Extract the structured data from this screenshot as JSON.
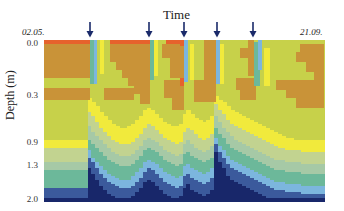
{
  "chart_data": {
    "type": "heatmap",
    "title": "Time",
    "xlabel": "Time",
    "ylabel": "Depth (m)",
    "x_start_label": "02.05.",
    "x_end_label": "21.09.",
    "y_ticks": [
      {
        "label": "0.0",
        "depth": 0.0
      },
      {
        "label": "0.3",
        "depth": 0.3
      },
      {
        "label": "0.9",
        "depth": 0.9
      },
      {
        "label": "1.3",
        "depth": 1.3
      },
      {
        "label": "2.0",
        "depth": 2.0
      }
    ],
    "ylim": [
      0.0,
      2.0
    ],
    "event_arrows_px": [
      90,
      149,
      184,
      217,
      253
    ],
    "colors": {
      "orange": "#e6622c",
      "brown": "#c99338",
      "yellowgreen": "#c7d14a",
      "yellow": "#f1ea3c",
      "pale": "#c2d390",
      "greygreen": "#a6c9a6",
      "teal": "#6cb89a",
      "lightblue": "#7cb6de",
      "blue": "#3b5a9c",
      "navy": "#18276a",
      "arrow": "#1a2a6a"
    },
    "columns": 70,
    "lower_layers_px_from_top": {
      "order": [
        "yellow",
        "pale",
        "greygreen",
        "teal",
        "lightblue",
        "blue",
        "navy"
      ],
      "values": [
        [
          100,
          108,
          122,
          130,
          148,
          148,
          158
        ],
        [
          100,
          108,
          122,
          130,
          148,
          148,
          158
        ],
        [
          100,
          108,
          122,
          130,
          148,
          148,
          158
        ],
        [
          100,
          108,
          122,
          130,
          148,
          148,
          158
        ],
        [
          100,
          108,
          122,
          130,
          148,
          148,
          158
        ],
        [
          100,
          108,
          122,
          130,
          148,
          148,
          158
        ],
        [
          100,
          108,
          122,
          130,
          148,
          148,
          158
        ],
        [
          100,
          108,
          122,
          130,
          148,
          148,
          158
        ],
        [
          100,
          108,
          122,
          130,
          148,
          148,
          158
        ],
        [
          100,
          108,
          122,
          130,
          148,
          148,
          158
        ],
        [
          100,
          108,
          122,
          130,
          148,
          148,
          158
        ],
        [
          58,
          72,
          86,
          100,
          110,
          118,
          128
        ],
        [
          62,
          76,
          92,
          104,
          118,
          122,
          134
        ],
        [
          66,
          82,
          96,
          108,
          122,
          128,
          140
        ],
        [
          72,
          88,
          100,
          112,
          126,
          134,
          146
        ],
        [
          76,
          92,
          104,
          116,
          130,
          138,
          150
        ],
        [
          80,
          96,
          108,
          120,
          134,
          142,
          154
        ],
        [
          84,
          100,
          112,
          122,
          136,
          144,
          156
        ],
        [
          86,
          102,
          114,
          124,
          138,
          146,
          158
        ],
        [
          88,
          104,
          116,
          126,
          140,
          148,
          158
        ],
        [
          88,
          104,
          116,
          126,
          140,
          148,
          158
        ],
        [
          86,
          104,
          116,
          126,
          140,
          148,
          158
        ],
        [
          84,
          102,
          114,
          124,
          136,
          146,
          156
        ],
        [
          80,
          98,
          110,
          120,
          132,
          142,
          152
        ],
        [
          76,
          94,
          106,
          116,
          128,
          138,
          148
        ],
        [
          70,
          88,
          100,
          110,
          122,
          132,
          142
        ],
        [
          68,
          84,
          98,
          108,
          120,
          128,
          140
        ],
        [
          70,
          86,
          100,
          110,
          122,
          130,
          142
        ],
        [
          74,
          90,
          102,
          112,
          124,
          134,
          146
        ],
        [
          78,
          94,
          106,
          116,
          128,
          138,
          150
        ],
        [
          82,
          98,
          110,
          120,
          132,
          142,
          154
        ],
        [
          84,
          100,
          112,
          122,
          134,
          144,
          156
        ],
        [
          86,
          102,
          114,
          124,
          136,
          146,
          158
        ],
        [
          86,
          104,
          116,
          126,
          138,
          148,
          158
        ],
        [
          84,
          102,
          114,
          124,
          136,
          146,
          156
        ],
        [
          74,
          92,
          104,
          114,
          126,
          136,
          148
        ],
        [
          70,
          88,
          100,
          112,
          124,
          134,
          144
        ],
        [
          74,
          90,
          104,
          116,
          128,
          138,
          150
        ],
        [
          78,
          94,
          108,
          118,
          130,
          140,
          152
        ],
        [
          80,
          98,
          110,
          120,
          132,
          142,
          154
        ],
        [
          82,
          100,
          112,
          122,
          134,
          144,
          156
        ],
        [
          80,
          98,
          110,
          120,
          132,
          142,
          154
        ],
        [
          76,
          94,
          106,
          118,
          128,
          138,
          150
        ],
        [
          56,
          64,
          76,
          88,
          98,
          104,
          112
        ],
        [
          60,
          70,
          82,
          94,
          106,
          112,
          122
        ],
        [
          62,
          74,
          88,
          98,
          110,
          118,
          128
        ],
        [
          66,
          80,
          92,
          104,
          116,
          124,
          136
        ],
        [
          70,
          84,
          96,
          108,
          120,
          128,
          140
        ],
        [
          72,
          86,
          100,
          110,
          122,
          130,
          142
        ],
        [
          74,
          88,
          102,
          112,
          124,
          132,
          144
        ],
        [
          76,
          90,
          104,
          114,
          126,
          134,
          146
        ],
        [
          78,
          92,
          106,
          116,
          128,
          136,
          148
        ],
        [
          80,
          94,
          108,
          118,
          130,
          138,
          150
        ],
        [
          82,
          96,
          110,
          120,
          132,
          140,
          152
        ],
        [
          84,
          98,
          112,
          122,
          134,
          142,
          154
        ],
        [
          86,
          100,
          114,
          124,
          136,
          144,
          156
        ],
        [
          88,
          102,
          116,
          126,
          138,
          146,
          158
        ],
        [
          90,
          104,
          118,
          128,
          140,
          148,
          160
        ],
        [
          92,
          106,
          120,
          130,
          142,
          150,
          162
        ],
        [
          94,
          108,
          120,
          130,
          142,
          150,
          162
        ],
        [
          96,
          108,
          120,
          130,
          142,
          150,
          162
        ],
        [
          98,
          110,
          122,
          132,
          144,
          152,
          162
        ],
        [
          98,
          110,
          122,
          132,
          144,
          152,
          162
        ],
        [
          100,
          110,
          122,
          132,
          144,
          152,
          162
        ],
        [
          100,
          110,
          122,
          132,
          144,
          152,
          162
        ],
        [
          100,
          112,
          124,
          134,
          146,
          154,
          162
        ],
        [
          100,
          112,
          124,
          134,
          146,
          154,
          162
        ],
        [
          100,
          112,
          124,
          134,
          146,
          154,
          162
        ],
        [
          100,
          112,
          124,
          134,
          146,
          154,
          162
        ],
        [
          100,
          112,
          124,
          134,
          146,
          154,
          162
        ],
        [
          100,
          112,
          124,
          134,
          146,
          154,
          162
        ]
      ]
    },
    "upper_blocks": [
      {
        "x": 0,
        "y": 0,
        "w": 46,
        "h": 4,
        "color": "orange"
      },
      {
        "x": 0,
        "y": 4,
        "w": 46,
        "h": 34,
        "color": "brown"
      },
      {
        "x": 20,
        "y": 30,
        "w": 26,
        "h": 8,
        "color": "brown"
      },
      {
        "x": 0,
        "y": 48,
        "w": 46,
        "h": 12,
        "color": "brown"
      },
      {
        "x": 46,
        "y": 0,
        "w": 5,
        "h": 44,
        "color": "teal"
      },
      {
        "x": 50,
        "y": 0,
        "w": 3,
        "h": 44,
        "color": "lightblue"
      },
      {
        "x": 56,
        "y": 0,
        "w": 4,
        "h": 34,
        "color": "yellow"
      },
      {
        "x": 66,
        "y": 0,
        "w": 40,
        "h": 4,
        "color": "orange"
      },
      {
        "x": 66,
        "y": 4,
        "w": 40,
        "h": 18,
        "color": "brown"
      },
      {
        "x": 72,
        "y": 22,
        "w": 34,
        "h": 8,
        "color": "brown"
      },
      {
        "x": 78,
        "y": 30,
        "w": 28,
        "h": 8,
        "color": "brown"
      },
      {
        "x": 84,
        "y": 38,
        "w": 22,
        "h": 8,
        "color": "brown"
      },
      {
        "x": 90,
        "y": 46,
        "w": 16,
        "h": 8,
        "color": "brown"
      },
      {
        "x": 60,
        "y": 48,
        "w": 30,
        "h": 12,
        "color": "brown"
      },
      {
        "x": 96,
        "y": 54,
        "w": 10,
        "h": 10,
        "color": "brown"
      },
      {
        "x": 106,
        "y": 0,
        "w": 4,
        "h": 40,
        "color": "teal"
      },
      {
        "x": 110,
        "y": 0,
        "w": 4,
        "h": 36,
        "color": "yellow"
      },
      {
        "x": 122,
        "y": 0,
        "w": 18,
        "h": 4,
        "color": "orange"
      },
      {
        "x": 118,
        "y": 4,
        "w": 22,
        "h": 14,
        "color": "brown"
      },
      {
        "x": 126,
        "y": 18,
        "w": 14,
        "h": 20,
        "color": "brown"
      },
      {
        "x": 120,
        "y": 40,
        "w": 20,
        "h": 18,
        "color": "brown"
      },
      {
        "x": 128,
        "y": 58,
        "w": 12,
        "h": 12,
        "color": "brown"
      },
      {
        "x": 136,
        "y": 0,
        "w": 4,
        "h": 6,
        "color": "orange"
      },
      {
        "x": 136,
        "y": 38,
        "w": 4,
        "h": 8,
        "color": "orange"
      },
      {
        "x": 140,
        "y": 0,
        "w": 4,
        "h": 42,
        "color": "lightblue"
      },
      {
        "x": 146,
        "y": 4,
        "w": 4,
        "h": 36,
        "color": "yellow"
      },
      {
        "x": 160,
        "y": 0,
        "w": 12,
        "h": 50,
        "color": "brown"
      },
      {
        "x": 150,
        "y": 40,
        "w": 22,
        "h": 22,
        "color": "brown"
      },
      {
        "x": 172,
        "y": 0,
        "w": 4,
        "h": 44,
        "color": "lightblue"
      },
      {
        "x": 176,
        "y": 4,
        "w": 4,
        "h": 40,
        "color": "yellow"
      },
      {
        "x": 192,
        "y": 38,
        "w": 20,
        "h": 12,
        "color": "brown"
      },
      {
        "x": 196,
        "y": 50,
        "w": 16,
        "h": 10,
        "color": "brown"
      },
      {
        "x": 196,
        "y": 8,
        "w": 12,
        "h": 10,
        "color": "brown"
      },
      {
        "x": 204,
        "y": 0,
        "w": 6,
        "h": 36,
        "color": "brown"
      },
      {
        "x": 210,
        "y": 2,
        "w": 6,
        "h": 44,
        "color": "teal"
      },
      {
        "x": 214,
        "y": 0,
        "w": 4,
        "h": 30,
        "color": "lightblue"
      },
      {
        "x": 220,
        "y": 8,
        "w": 6,
        "h": 38,
        "color": "yellow"
      },
      {
        "x": 232,
        "y": 40,
        "w": 46,
        "h": 10,
        "color": "brown"
      },
      {
        "x": 242,
        "y": 50,
        "w": 36,
        "h": 8,
        "color": "brown"
      },
      {
        "x": 252,
        "y": 58,
        "w": 26,
        "h": 10,
        "color": "brown"
      },
      {
        "x": 256,
        "y": 4,
        "w": 24,
        "h": 8,
        "color": "brown"
      },
      {
        "x": 252,
        "y": 12,
        "w": 28,
        "h": 10,
        "color": "brown"
      },
      {
        "x": 262,
        "y": 22,
        "w": 18,
        "h": 10,
        "color": "brown"
      },
      {
        "x": 270,
        "y": 32,
        "w": 10,
        "h": 36,
        "color": "brown"
      }
    ]
  }
}
